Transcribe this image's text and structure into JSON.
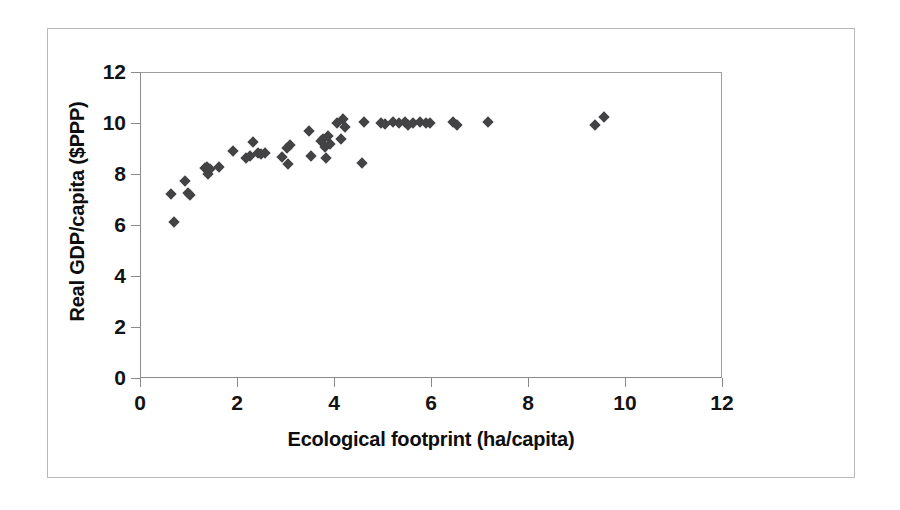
{
  "chart_data": {
    "type": "scatter",
    "title": "",
    "subtitle": "",
    "xlabel": "Ecological footprint (ha/capita)",
    "ylabel": "Real GDP/capita ($PPP)",
    "xlim": [
      0,
      12
    ],
    "ylim": [
      0,
      12
    ],
    "xticks": [
      0,
      2,
      4,
      6,
      8,
      10,
      12
    ],
    "yticks": [
      0,
      2,
      4,
      6,
      8,
      10,
      12
    ],
    "xtick_labels": [
      "0",
      "2",
      "4",
      "6",
      "8",
      "10",
      "12"
    ],
    "ytick_labels": [
      "0",
      "2",
      "4",
      "6",
      "8",
      "10",
      "12"
    ],
    "grid": false,
    "legend": null,
    "legend_position": "none",
    "marker": {
      "shape": "diamond",
      "color": "#434345",
      "size": 8
    },
    "series": [
      {
        "name": "Countries",
        "points": [
          [
            0.62,
            7.22
          ],
          [
            0.68,
            6.12
          ],
          [
            0.92,
            7.72
          ],
          [
            0.98,
            7.28
          ],
          [
            1.02,
            7.18
          ],
          [
            1.32,
            8.24
          ],
          [
            1.36,
            8.3
          ],
          [
            1.38,
            8.02
          ],
          [
            1.42,
            8.22
          ],
          [
            1.62,
            8.3
          ],
          [
            1.9,
            8.92
          ],
          [
            2.18,
            8.66
          ],
          [
            2.26,
            8.74
          ],
          [
            2.32,
            9.26
          ],
          [
            2.42,
            8.84
          ],
          [
            2.48,
            8.82
          ],
          [
            2.56,
            8.86
          ],
          [
            2.92,
            8.68
          ],
          [
            3.02,
            9.02
          ],
          [
            3.04,
            8.42
          ],
          [
            3.08,
            9.14
          ],
          [
            3.48,
            9.72
          ],
          [
            3.52,
            8.74
          ],
          [
            3.72,
            9.32
          ],
          [
            3.76,
            9.4
          ],
          [
            3.8,
            9.08
          ],
          [
            3.82,
            8.64
          ],
          [
            3.86,
            9.52
          ],
          [
            3.9,
            9.18
          ],
          [
            4.06,
            10.02
          ],
          [
            4.14,
            9.4
          ],
          [
            4.18,
            10.18
          ],
          [
            4.22,
            9.86
          ],
          [
            4.58,
            8.45
          ],
          [
            4.62,
            10.06
          ],
          [
            4.96,
            10.04
          ],
          [
            5.04,
            10.0
          ],
          [
            5.22,
            10.06
          ],
          [
            5.34,
            10.04
          ],
          [
            5.46,
            10.06
          ],
          [
            5.52,
            9.94
          ],
          [
            5.62,
            10.04
          ],
          [
            5.78,
            10.06
          ],
          [
            5.9,
            10.02
          ],
          [
            5.98,
            10.04
          ],
          [
            6.46,
            10.06
          ],
          [
            6.54,
            9.94
          ],
          [
            7.18,
            10.06
          ],
          [
            9.4,
            9.94
          ],
          [
            9.58,
            10.28
          ]
        ]
      }
    ],
    "n_points": 50
  },
  "figure": {
    "frame_visible": true,
    "background_color": "#ffffff",
    "border_color": "#b9b9bb",
    "axis_color": "#8a8a8c",
    "text_color": "#131313"
  }
}
